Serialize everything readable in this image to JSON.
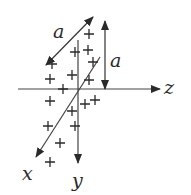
{
  "diagram": {
    "axes": {
      "x": {
        "label": "x"
      },
      "y": {
        "label": "y"
      },
      "z": {
        "label": "z"
      }
    },
    "dimensions": [
      {
        "name": "diagonal-length",
        "label": "a"
      },
      {
        "name": "vertical-length",
        "label": "a"
      }
    ],
    "markers": {
      "symbol": "+",
      "count": 17
    },
    "colors": {
      "ink": "#2a2a2a",
      "background": "#ffffff"
    }
  }
}
